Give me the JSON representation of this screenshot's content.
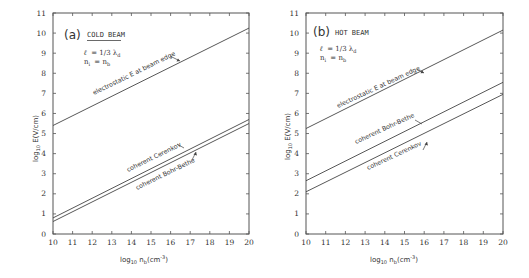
{
  "chart_data": [
    {
      "type": "line",
      "panel": "(a)",
      "title": "COLD BEAM",
      "parameters": [
        "ℓ = 1/3 λd",
        "ni = nb"
      ],
      "xlabel": "log10 nb(cm⁻³)",
      "ylabel": "log10 E(V/cm)",
      "xlim": [
        10,
        20
      ],
      "ylim": [
        0,
        11
      ],
      "x_ticks": [
        10,
        11,
        12,
        13,
        14,
        15,
        16,
        17,
        18,
        19,
        20
      ],
      "y_ticks": [
        0,
        1,
        2,
        3,
        4,
        5,
        6,
        7,
        8,
        9,
        10,
        11
      ],
      "grid": false,
      "legend": "none (inline annotations)",
      "x": [
        10,
        20
      ],
      "series": [
        {
          "name": "electrostatic E at beam edge",
          "values": [
            5.4,
            10.25
          ]
        },
        {
          "name": "coherent Cerenkov",
          "values": [
            0.8,
            5.7
          ]
        },
        {
          "name": "coherent Bohr-Bethe",
          "values": [
            0.62,
            5.5
          ]
        }
      ]
    },
    {
      "type": "line",
      "panel": "(b)",
      "title": "HOT BEAM",
      "parameters": [
        "ℓ = 1/3 λd",
        "ni = nb"
      ],
      "xlabel": "log10 nb(cm⁻³)",
      "ylabel": "log10 E(V/cm)",
      "xlim": [
        10,
        20
      ],
      "ylim": [
        0,
        11
      ],
      "x_ticks": [
        10,
        11,
        12,
        13,
        14,
        15,
        16,
        17,
        18,
        19,
        20
      ],
      "y_ticks": [
        0,
        1,
        2,
        3,
        4,
        5,
        6,
        7,
        8,
        9,
        10,
        11
      ],
      "grid": false,
      "legend": "none (inline annotations)",
      "x": [
        10,
        20
      ],
      "series": [
        {
          "name": "electrostatic E at beam edge",
          "values": [
            5.25,
            10.15
          ]
        },
        {
          "name": "coherent Bohr-Bethe",
          "values": [
            2.65,
            7.55
          ]
        },
        {
          "name": "coherent Cerenkov",
          "values": [
            2.1,
            6.95
          ]
        }
      ]
    }
  ],
  "panels": {
    "left": {
      "tag": "(a)",
      "title": "COLD BEAM",
      "param_l": "ℓ",
      "param_l_value": "= 1/3 λ",
      "param_l_sub": "d",
      "param_n": "n",
      "param_n_sub_i": "i",
      "param_n_eq": "= n",
      "param_n_sub_b": "b",
      "annot_electrostatic": "electrostatic  E  at beam edge",
      "annot_cerenkov": "coherent  Cerenkov",
      "annot_bohr": "coherent  Bohr-Bethe",
      "ylabel_prefix": "log",
      "ylabel_sub": "10",
      "ylabel_rest": " E(V/cm)",
      "xlabel_prefix": "log",
      "xlabel_sub": "10",
      "xlabel_n": "  n",
      "xlabel_nsub": "b",
      "xlabel_unit": "(cm",
      "xlabel_exp": "-3",
      "xlabel_close": ")"
    },
    "right": {
      "tag": "(b)",
      "title": "HOT  BEAM",
      "param_l": "ℓ",
      "param_l_value": "= 1/3 λ",
      "param_l_sub": "d",
      "param_n": "n",
      "param_n_sub_i": "i",
      "param_n_eq": "= n",
      "param_n_sub_b": "b",
      "annot_electrostatic": "electrostatic E at beam edge",
      "annot_cerenkov": "coherent  Cerenkov",
      "annot_bohr": "coherent  Bohr-Bethe",
      "ylabel_prefix": "log",
      "ylabel_sub": "10",
      "ylabel_rest": " E(V/cm)",
      "xlabel_prefix": "log",
      "xlabel_sub": "10",
      "xlabel_n": "  n",
      "xlabel_nsub": "b",
      "xlabel_unit": "(cm",
      "xlabel_exp": "-3",
      "xlabel_close": ")"
    }
  },
  "tick_labels": {
    "x": [
      "10",
      "11",
      "12",
      "13",
      "14",
      "15",
      "16",
      "17",
      "18",
      "19",
      "20"
    ],
    "y": [
      "0",
      "1",
      "2",
      "3",
      "4",
      "5",
      "6",
      "7",
      "8",
      "9",
      "10",
      "11"
    ]
  }
}
